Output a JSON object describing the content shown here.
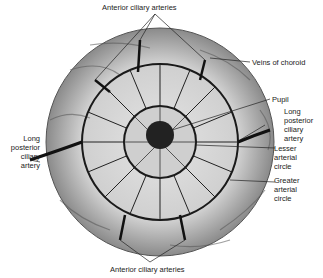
{
  "labels": {
    "top": "Anterior ciliary arteries",
    "veins": "Veins of choroid",
    "pupil": "Pupil",
    "long_right_1": "Long",
    "long_right_2": "posterior",
    "long_right_3": "ciliary",
    "long_right_4": "artery",
    "lesser_1": "Lesser",
    "lesser_2": "arterial",
    "lesser_3": "circle",
    "greater_1": "Greater",
    "greater_2": "arterial",
    "greater_3": "circle",
    "long_left_1": "Long",
    "long_left_2": "posterior",
    "long_left_3": "ciliary",
    "long_left_4": "artery",
    "bottom": "Anterior ciliary arteries"
  },
  "colors": {
    "vessel": "#1a1a1a",
    "background": "#d8d8d8",
    "pupil": "#222222"
  }
}
